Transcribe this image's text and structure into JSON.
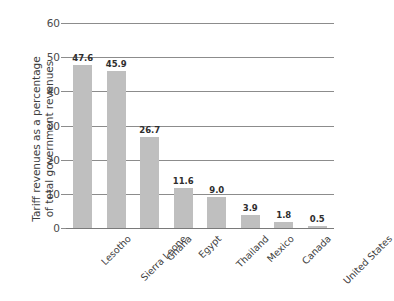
{
  "chart_data": {
    "type": "bar",
    "title": "",
    "subtitle": "",
    "xlabel": "",
    "ylabel": "Tariff revenues as a percentage of total government revenues",
    "ylabel_lines": [
      "Tariff revenues as a percentage",
      "of total government revenues"
    ],
    "categories": [
      "Lesotho",
      "Sierra Leone",
      "Ghana",
      "Egypt",
      "Thailand",
      "Mexico",
      "Canada",
      "United States"
    ],
    "values": [
      47.6,
      45.9,
      26.7,
      11.6,
      9.0,
      3.9,
      1.8,
      0.5
    ],
    "value_labels": [
      "47.6",
      "45.9",
      "26.7",
      "11.6",
      "9.0",
      "3.9",
      "1.8",
      "0.5"
    ],
    "ylim": [
      0,
      60
    ],
    "yticks": [
      0,
      10,
      20,
      30,
      40,
      50,
      60
    ],
    "ytick_labels": [
      "0",
      "10",
      "20",
      "30",
      "40",
      "50",
      "60"
    ],
    "grid": true,
    "grid_axis": "y",
    "legend": false,
    "legend_position": "none",
    "bar_color": "#bfbfbf",
    "grid_color": "#8c8c8c",
    "text_color": "#3d3d3d",
    "background_color": "#ffffff"
  }
}
